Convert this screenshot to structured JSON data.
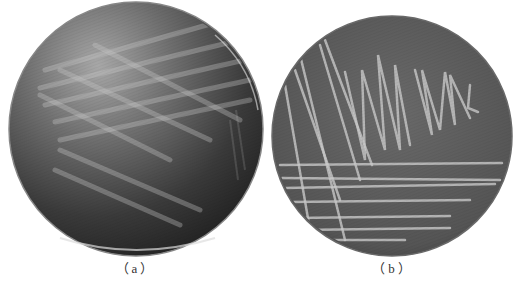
{
  "figure": {
    "panels": [
      {
        "id": "a",
        "caption": "（a）",
        "description": "Petri dish with faint streak culture on dark agar",
        "center": [
          136,
          129
        ],
        "radius": 127,
        "agar_color": "#3a3a3a"
      },
      {
        "id": "b",
        "caption": "（b）",
        "description": "Petri dish with prominent streak colonies (quadrant streak)",
        "center": [
          392,
          136
        ],
        "radius": 120,
        "agar_color": "#5a5a5a"
      }
    ]
  }
}
